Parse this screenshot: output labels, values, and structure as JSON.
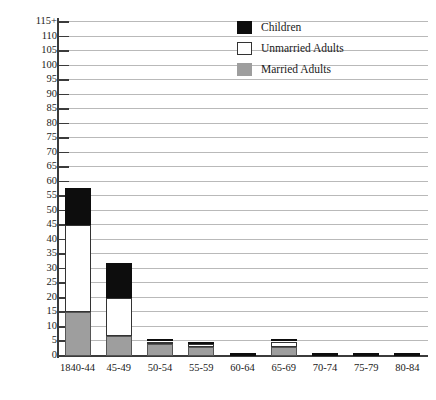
{
  "chart_data": {
    "type": "bar",
    "subtype": "stacked-vertical",
    "title": "",
    "xlabel": "",
    "ylabel": "",
    "categories": [
      "1840-44",
      "45-49",
      "50-54",
      "55-59",
      "60-64",
      "65-69",
      "70-74",
      "75-79",
      "80-84"
    ],
    "series": [
      {
        "name": "Married Adults",
        "color": "#9e9e9e",
        "values": [
          15,
          7,
          4,
          3,
          0,
          3,
          0,
          0,
          0
        ]
      },
      {
        "name": "Unmarried Adults",
        "color": "#ffffff",
        "values": [
          30,
          13,
          1,
          1,
          0,
          2,
          0,
          0,
          0
        ]
      },
      {
        "name": "Children",
        "color": "#0d0d0d",
        "values": [
          13,
          12,
          1,
          1,
          1,
          1,
          1,
          1,
          1
        ]
      }
    ],
    "totals": [
      58,
      32,
      6,
      5,
      1,
      6,
      1,
      1,
      1
    ],
    "ylim": [
      0,
      115
    ],
    "ytick_step": 5,
    "ytick_labels": [
      "0",
      "5",
      "10",
      "15",
      "20",
      "25",
      "30",
      "35",
      "40",
      "45",
      "50",
      "55",
      "60",
      "65",
      "70",
      "75",
      "80",
      "85",
      "90",
      "95",
      "100",
      "105",
      "110",
      "115+"
    ],
    "grid": true,
    "grid_orientation": "horizontal",
    "legend_position": "top-center-right",
    "legend": [
      {
        "label": "Children",
        "color": "#0d0d0d"
      },
      {
        "label": "Unmarried Adults",
        "color": "#ffffff"
      },
      {
        "label": "Married Adults",
        "color": "#9e9e9e"
      }
    ]
  }
}
